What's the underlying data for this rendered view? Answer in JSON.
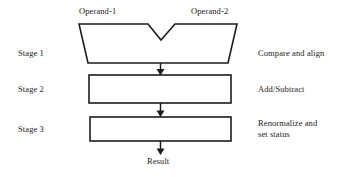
{
  "diagram": {
    "inputs": [
      {
        "id": "operand-1",
        "label": "Operand-1"
      },
      {
        "id": "operand-2",
        "label": "Operand-2"
      }
    ],
    "stages": [
      {
        "id": "stage-1",
        "stage_label": "Stage 1",
        "function_label": "Compare and align",
        "shape": "trapezoid-with-notch"
      },
      {
        "id": "stage-2",
        "stage_label": "Stage 2",
        "function_label": "Add/Subtract",
        "shape": "rectangle"
      },
      {
        "id": "stage-3",
        "stage_label": "Stage 3",
        "function_label_line1": "Renormalize and",
        "function_label_line2": "set status",
        "shape": "rectangle"
      }
    ],
    "output": {
      "id": "result",
      "label": "Result"
    },
    "colors": {
      "stroke": "#1c1c1c",
      "fill": "#ffffff",
      "text": "#232323",
      "background": "#ffffff"
    }
  }
}
